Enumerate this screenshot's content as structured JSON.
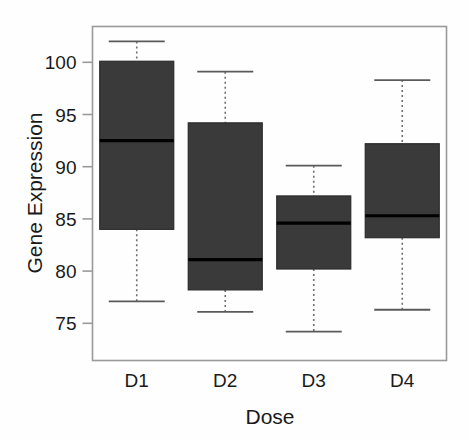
{
  "chart_data": {
    "type": "box",
    "title": "",
    "xlabel": "Dose",
    "ylabel": "Gene Expression",
    "categories": [
      "D1",
      "D2",
      "D3",
      "D4"
    ],
    "ytick_labels": [
      "75",
      "80",
      "85",
      "90",
      "95",
      "100"
    ],
    "yticks": [
      75,
      80,
      85,
      90,
      95,
      100
    ],
    "ylim": [
      73.2,
      103.5
    ],
    "grid": false,
    "legend": "none",
    "box_fill_color": "#3a3a3a",
    "box_border_color": "#2b2b2b",
    "median_color": "#000000",
    "whisker_style": "dashed",
    "boxes": [
      {
        "category": "D1",
        "lower_whisker": 77.1,
        "q1": 84.0,
        "median": 92.5,
        "q3": 100.1,
        "upper_whisker": 102.0
      },
      {
        "category": "D2",
        "lower_whisker": 76.1,
        "q1": 78.2,
        "median": 81.1,
        "q3": 94.2,
        "upper_whisker": 99.1
      },
      {
        "category": "D3",
        "lower_whisker": 74.2,
        "q1": 80.2,
        "median": 84.6,
        "q3": 87.2,
        "upper_whisker": 90.1
      },
      {
        "category": "D4",
        "lower_whisker": 76.3,
        "q1": 83.2,
        "median": 85.3,
        "q3": 92.2,
        "upper_whisker": 98.3
      }
    ]
  }
}
